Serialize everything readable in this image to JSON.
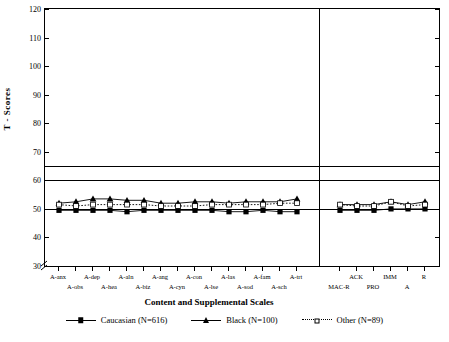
{
  "chart_data": {
    "type": "line",
    "title": "",
    "xlabel": "Content and Supplemental Scales",
    "ylabel": "T - Scores",
    "ylim": [
      30,
      120
    ],
    "yticks": [
      30,
      40,
      50,
      60,
      70,
      80,
      90,
      100,
      110,
      120
    ],
    "axis_break": true,
    "grid": false,
    "reference_lines": [
      50,
      60,
      65
    ],
    "group_divider_after": "A-trt",
    "categories": [
      "A-anx",
      "A-obs",
      "A-dep",
      "A-hea",
      "A-aln",
      "A-biz",
      "A-ang",
      "A-cyn",
      "A-con",
      "A-lse",
      "A-las",
      "A-sod",
      "A-fam",
      "A-sch",
      "A-trt",
      "MAC-R",
      "ACK",
      "PRO",
      "IMM",
      "A",
      "R"
    ],
    "series": [
      {
        "name": "Caucasian (N=616)",
        "marker": "filled-square",
        "line": "solid",
        "values": [
          49.5,
          49.5,
          49.5,
          49.5,
          49.0,
          49.5,
          49.5,
          49.5,
          49.5,
          49.5,
          49.0,
          49.0,
          49.5,
          49.0,
          49.0,
          49.5,
          49.5,
          49.5,
          50.0,
          50.0,
          50.0
        ]
      },
      {
        "name": "Black (N=100)",
        "marker": "filled-triangle",
        "line": "solid",
        "values": [
          52.0,
          52.5,
          53.5,
          53.5,
          53.0,
          53.0,
          52.0,
          52.0,
          52.5,
          52.5,
          52.0,
          52.5,
          52.5,
          52.5,
          53.5,
          51.5,
          51.5,
          51.5,
          52.5,
          51.5,
          52.5
        ]
      },
      {
        "name": "Other (N=89)",
        "marker": "open-square",
        "line": "dotted",
        "values": [
          51.5,
          51.0,
          51.5,
          51.5,
          51.5,
          51.5,
          51.0,
          51.0,
          51.0,
          51.5,
          51.5,
          51.5,
          51.5,
          52.0,
          52.0,
          51.5,
          51.0,
          51.0,
          52.5,
          51.0,
          51.5
        ]
      }
    ],
    "legend": {
      "position": "bottom",
      "entries": [
        {
          "label": "Caucasian (N=616)",
          "marker": "filled-square",
          "line": "solid"
        },
        {
          "label": "Black (N=100)",
          "marker": "filled-triangle",
          "line": "solid"
        },
        {
          "label": "Other (N=89)",
          "marker": "open-square",
          "line": "dotted"
        }
      ]
    }
  }
}
